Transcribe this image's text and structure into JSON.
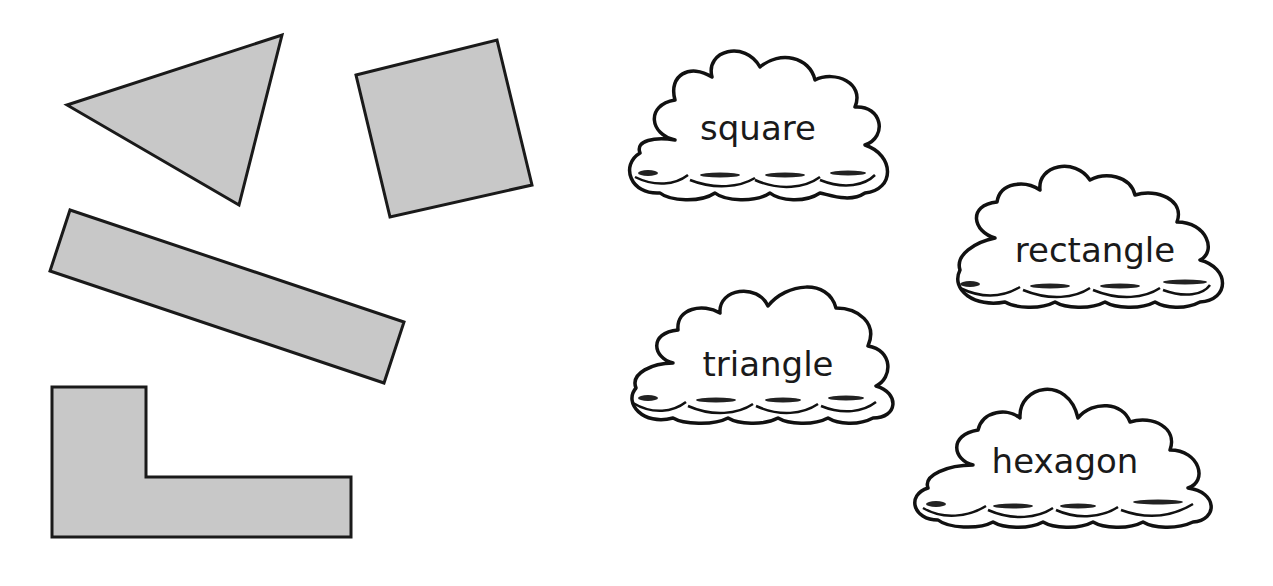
{
  "worksheet": {
    "shapes": [
      {
        "name": "triangle",
        "points": "67,105 282,35 239,205"
      },
      {
        "name": "square",
        "points": "356,75 497,40 532,185 390,217"
      },
      {
        "name": "rectangle",
        "points": "70,210 404,322 384,383 50,271"
      },
      {
        "name": "l-shape",
        "points": "52,387 146,387 146,477 351,477 351,537 52,537"
      }
    ],
    "fill_color": "#c8c8c8",
    "stroke_color": "#1a1a1a",
    "word_clouds": [
      {
        "label": "square",
        "x": 620,
        "y": 45,
        "w": 275,
        "h": 155
      },
      {
        "label": "rectangle",
        "x": 945,
        "y": 160,
        "w": 290,
        "h": 150
      },
      {
        "label": "triangle",
        "x": 618,
        "y": 278,
        "w": 272,
        "h": 145
      },
      {
        "label": "hexagon",
        "x": 908,
        "y": 370,
        "w": 315,
        "h": 160
      }
    ]
  }
}
